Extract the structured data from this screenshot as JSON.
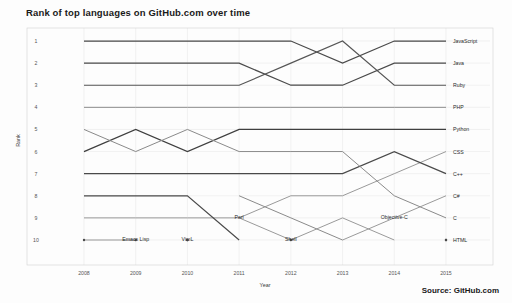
{
  "title": "Rank of top languages on GitHub.com over time",
  "source": "Source: GitHub.com",
  "axis": {
    "xlabel": "Year",
    "ylabel": "Rank"
  },
  "chart_data": {
    "type": "line",
    "subtype": "bump-rank-chart",
    "title": "Rank of top languages on GitHub.com over time",
    "xlabel": "Year",
    "ylabel": "Rank",
    "grid": true,
    "legend": "right-of-line-ends",
    "source": "Source: GitHub.com",
    "x": [
      2008,
      2009,
      2010,
      2011,
      2012,
      2013,
      2014,
      2015
    ],
    "xticklabels": [
      "2008",
      "2009",
      "2010",
      "2011",
      "2012",
      "2013",
      "2014",
      "2015"
    ],
    "yticklabels": [
      "1",
      "2",
      "3",
      "4",
      "5",
      "6",
      "7",
      "8",
      "9",
      "10"
    ],
    "ylim": [
      10.6,
      0.4
    ],
    "y_inverted": true,
    "note": "Rank 1 is best and drawn at the top; null means the language is outside the top 10 that year.",
    "series": [
      {
        "name": "JavaScript",
        "values": [
          1,
          1,
          1,
          1,
          1,
          2,
          1,
          1
        ]
      },
      {
        "name": "Java",
        "values": [
          2,
          2,
          2,
          2,
          3,
          3,
          2,
          2
        ]
      },
      {
        "name": "Ruby",
        "values": [
          3,
          3,
          3,
          3,
          2,
          1,
          3,
          3
        ]
      },
      {
        "name": "PHP",
        "values": [
          4,
          4,
          4,
          4,
          4,
          4,
          4,
          4
        ]
      },
      {
        "name": "Python",
        "values": [
          6,
          5,
          6,
          5,
          5,
          5,
          5,
          5
        ]
      },
      {
        "name": "CSS",
        "values": [
          9,
          9,
          9,
          9,
          8,
          8,
          7,
          6
        ]
      },
      {
        "name": "C++",
        "values": [
          7,
          7,
          7,
          7,
          7,
          7,
          6,
          7
        ]
      },
      {
        "name": "C#",
        "values": [
          null,
          null,
          null,
          null,
          null,
          10,
          9,
          8
        ]
      },
      {
        "name": "C",
        "values": [
          5,
          6,
          5,
          6,
          6,
          6,
          8,
          9
        ]
      },
      {
        "name": "HTML",
        "values": [
          null,
          null,
          null,
          null,
          null,
          null,
          null,
          10
        ]
      },
      {
        "name": "Perl",
        "values": [
          8,
          8,
          8,
          10,
          null,
          null,
          null,
          null
        ]
      },
      {
        "name": "Shell",
        "values": [
          null,
          null,
          null,
          9,
          10,
          9,
          10,
          null
        ]
      },
      {
        "name": "Emacs Lisp",
        "values": [
          10,
          10,
          null,
          null,
          null,
          null,
          null,
          null
        ]
      },
      {
        "name": "VimL",
        "values": [
          null,
          null,
          10,
          null,
          null,
          null,
          null,
          null
        ]
      },
      {
        "name": "Objective-C",
        "values": [
          null,
          null,
          null,
          8,
          9,
          10,
          null,
          null
        ]
      }
    ]
  },
  "right_labels": [
    {
      "name": "JavaScript",
      "rank": 1
    },
    {
      "name": "Java",
      "rank": 2
    },
    {
      "name": "Ruby",
      "rank": 3
    },
    {
      "name": "PHP",
      "rank": 4
    },
    {
      "name": "Python",
      "rank": 5
    },
    {
      "name": "CSS",
      "rank": 6
    },
    {
      "name": "C++",
      "rank": 7
    },
    {
      "name": "C#",
      "rank": 8
    },
    {
      "name": "C",
      "rank": 9
    },
    {
      "name": "HTML",
      "rank": 10
    }
  ],
  "inline_annotations": [
    {
      "name": "Emacs Lisp",
      "year": 2009,
      "rank": 10
    },
    {
      "name": "VimL",
      "year": 2010,
      "rank": 10
    },
    {
      "name": "Perl",
      "year": 2011,
      "rank": 9
    },
    {
      "name": "Shell",
      "year": 2012,
      "rank": 10
    },
    {
      "name": "Objective-C",
      "year": 2014,
      "rank": 9
    }
  ],
  "colors": {
    "background": "#fdfdfd",
    "grid": "#e9e9e9",
    "frame": "#d8d8d8",
    "dark_line": "#4a4a4a",
    "mid_line": "#7a7a7a",
    "light_line": "#a8a8a8",
    "text": "#2b2b2b"
  }
}
